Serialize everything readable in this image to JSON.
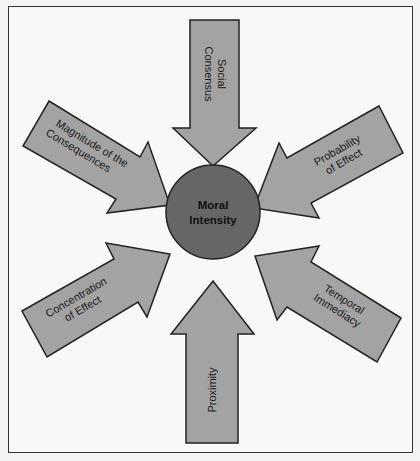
{
  "diagram": {
    "title": "Moral Intensity",
    "center": {
      "label_line1": "Moral",
      "label_line2": "Intensity"
    },
    "colors": {
      "arrow_fill": "#a3a3a3",
      "circle_fill": "#666666",
      "stroke": "#222222",
      "background": "#f8f8f6"
    },
    "factors": [
      {
        "id": "social-consensus",
        "line1": "Social",
        "line2": "Consensus"
      },
      {
        "id": "probability-of-effect",
        "line1": "Probability",
        "line2": "of Effect"
      },
      {
        "id": "temporal-immediacy",
        "line1": "Temporal",
        "line2": "Immediacy"
      },
      {
        "id": "proximity",
        "line1": "Proximity",
        "line2": ""
      },
      {
        "id": "concentration-of-effect",
        "line1": "Concentration",
        "line2": "of Effect"
      },
      {
        "id": "magnitude-of-consequences",
        "line1": "Magnitude of the",
        "line2": "Consequences"
      }
    ]
  }
}
